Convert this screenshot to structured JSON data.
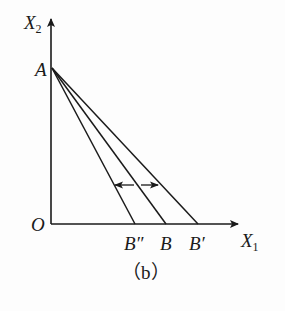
{
  "diagram": {
    "caption": "（b）",
    "axes": {
      "y_label": "X",
      "y_sub": "2",
      "x_label": "X",
      "x_sub": "1",
      "origin": "O"
    },
    "points": {
      "A": "A",
      "B_double_prime": "B″",
      "B": "B",
      "B_prime": "B′"
    },
    "lines": [
      {
        "from": "A",
        "to": "B″"
      },
      {
        "from": "A",
        "to": "B"
      },
      {
        "from": "A",
        "to": "B′"
      }
    ],
    "shift_arrows": [
      "left",
      "right"
    ],
    "colors": {
      "ink": "#1a1a1a",
      "background": "#fdfdfd"
    }
  }
}
